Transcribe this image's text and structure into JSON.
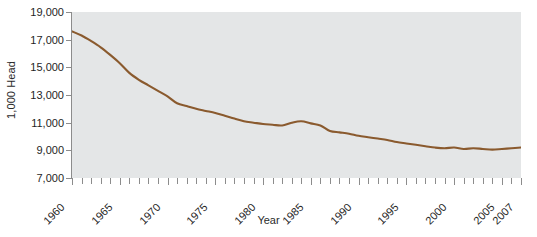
{
  "chart_data": {
    "type": "line",
    "title": "",
    "subtitle": "",
    "xlabel": "Year",
    "ylabel": "1,000 Head",
    "xlim": [
      1960,
      2007
    ],
    "ylim": [
      7000,
      19000
    ],
    "grid": false,
    "legend": null,
    "line_color": "#8a5a2e",
    "plot_background": "#e4e6e7",
    "axis_color": "#8c8c8c",
    "y_ticks": [
      19000,
      17000,
      15000,
      13000,
      11000,
      9000,
      7000
    ],
    "y_tick_labels": [
      "19,000",
      "17,000",
      "15,000",
      "13,000",
      "11,000",
      "9,000",
      "7,000"
    ],
    "x_ticks_minor_step": 1,
    "x_tick_labels": [
      "1960",
      "1965",
      "1970",
      "1975",
      "1980",
      "1985",
      "1990",
      "1995",
      "2000",
      "2005",
      "2007"
    ],
    "x_tick_label_years": [
      1960,
      1965,
      1970,
      1975,
      1980,
      1985,
      1990,
      1995,
      2000,
      2005,
      2007
    ],
    "x": [
      1960,
      1961,
      1962,
      1963,
      1964,
      1965,
      1966,
      1967,
      1968,
      1969,
      1970,
      1971,
      1972,
      1973,
      1974,
      1975,
      1976,
      1977,
      1978,
      1979,
      1980,
      1981,
      1982,
      1983,
      1984,
      1985,
      1986,
      1987,
      1988,
      1989,
      1990,
      1991,
      1992,
      1993,
      1994,
      1995,
      1996,
      1997,
      1998,
      1999,
      2000,
      2001,
      2002,
      2003,
      2004,
      2005,
      2006,
      2007
    ],
    "series": [
      {
        "name": "Milk cow inventory",
        "values": [
          17600,
          17300,
          16900,
          16450,
          15900,
          15300,
          14600,
          14100,
          13700,
          13300,
          12900,
          12400,
          12200,
          12000,
          11850,
          11700,
          11500,
          11300,
          11100,
          11000,
          10900,
          10850,
          10800,
          11000,
          11100,
          10950,
          10800,
          10400,
          10300,
          10200,
          10050,
          9950,
          9850,
          9750,
          9600,
          9500,
          9400,
          9300,
          9200,
          9150,
          9200,
          9100,
          9150,
          9100,
          9050,
          9100,
          9150,
          9200
        ]
      }
    ]
  }
}
